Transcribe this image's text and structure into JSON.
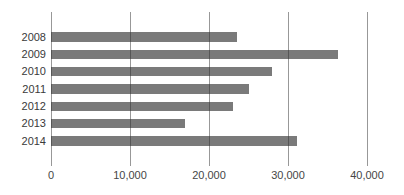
{
  "chart_data": {
    "type": "bar",
    "orientation": "horizontal",
    "title": "",
    "xlabel": "",
    "ylabel": "",
    "categories": [
      "2008",
      "2009",
      "2010",
      "2011",
      "2012",
      "2013",
      "2014"
    ],
    "values": [
      23500,
      36300,
      28000,
      25100,
      23000,
      16900,
      31100
    ],
    "xlim": [
      0,
      40000
    ],
    "xticks": [
      0,
      10000,
      20000,
      30000,
      40000
    ],
    "xtick_labels": [
      "0",
      "10,000",
      "20,000",
      "30,000",
      "40,000"
    ],
    "grid": "vertical-only",
    "legend": "none",
    "colors": {
      "bar": "#7a7a7a",
      "gridline": "#666666",
      "year_label_text": "#3a3a3a",
      "tick_label_text": "#464646",
      "background": "#ffffff"
    }
  }
}
